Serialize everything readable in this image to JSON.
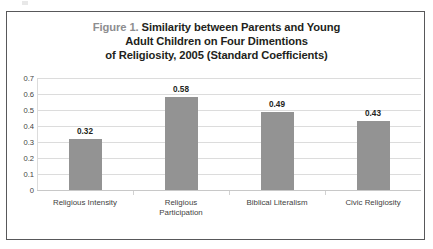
{
  "figure": {
    "title_prefix": "Figure 1.",
    "title_lines": [
      "Similarity between Parents and Young",
      "Adult Children on Four Dimentions",
      "of Religiosity, 2005 (Standard Coefficients)"
    ],
    "border_color": "#58585a",
    "title_prefix_color": "#8d8d8f",
    "title_color": "#231f20"
  },
  "chart_data": {
    "type": "bar",
    "title": "Figure 1. Similarity between Parents and Young Adult Children on Four Dimentions of Religiosity, 2005 (Standard Coefficients)",
    "categories": [
      "Religious Intensity",
      "Religious Participation",
      "Biblical Literalism",
      "Civic Religiosity"
    ],
    "category_label_lines": [
      [
        "Religious Intensity"
      ],
      [
        "Religious",
        "Participation"
      ],
      [
        "Biblical Literalism"
      ],
      [
        "Civic Religiosity"
      ]
    ],
    "values": [
      0.32,
      0.58,
      0.49,
      0.43
    ],
    "value_labels": [
      "0.32",
      "0.58",
      "0.49",
      "0.43"
    ],
    "xlabel": "",
    "ylabel": "",
    "ylim": [
      0,
      0.7
    ],
    "ytick_labels": [
      "0.7",
      "0.6",
      "0.5",
      "0.4",
      "0.3",
      "0.2",
      "0.1",
      "0"
    ],
    "ytick_values": [
      0.7,
      0.6,
      0.5,
      0.4,
      0.3,
      0.2,
      0.1,
      0
    ],
    "grid": true,
    "grid_color": "#dcdcdc",
    "legend": false,
    "bar_color": "#939393",
    "series": [
      {
        "name": "Standard Coefficients",
        "values": [
          0.32,
          0.58,
          0.49,
          0.43
        ]
      }
    ]
  }
}
